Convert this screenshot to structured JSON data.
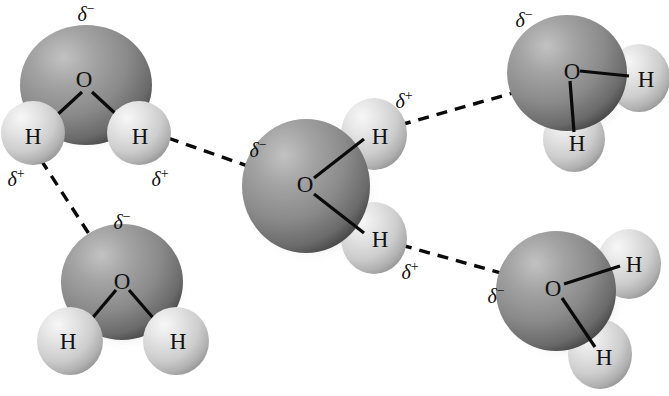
{
  "figure": {
    "background_color": "#ffffff",
    "width": 669,
    "height": 396,
    "atom_labels": {
      "oxygen": "O",
      "hydrogen": "H"
    },
    "charge_labels": {
      "negative": "δ",
      "negative_sign": "−",
      "positive": "δ",
      "positive_sign": "+"
    },
    "colors": {
      "oxygen_sphere_light": "#b9b9b9",
      "oxygen_sphere_mid": "#8d8d8d",
      "oxygen_sphere_dark": "#4f4f4f",
      "hydrogen_sphere_light": "#f2f2f2",
      "hydrogen_sphere_mid": "#d6d6d6",
      "hydrogen_sphere_dark": "#a3a3a3",
      "bond_color": "#0a0a0a",
      "text_color": "#111111"
    }
  },
  "molecules": [
    {
      "id": "water-top-left",
      "name": "water-molecule-top-left",
      "oxygen": {
        "label": "O",
        "cx": 86,
        "cy": 85,
        "rx": 66,
        "ry": 60,
        "label_x": 84,
        "label_y": 79
      },
      "hydrogens": [
        {
          "label": "H",
          "cx": 33,
          "cy": 133,
          "rx": 32,
          "ry": 32,
          "label_x": 33,
          "label_y": 136
        },
        {
          "label": "H",
          "cx": 139,
          "cy": 133,
          "rx": 32,
          "ry": 32,
          "label_x": 140,
          "label_y": 136
        }
      ],
      "charges": [
        {
          "kind": "negative",
          "x": 86,
          "y": 14
        },
        {
          "kind": "positive",
          "x": 16,
          "y": 179
        },
        {
          "kind": "positive",
          "x": 160,
          "y": 179
        }
      ]
    },
    {
      "id": "water-center",
      "name": "water-molecule-center",
      "oxygen": {
        "label": "O",
        "cx": 306,
        "cy": 186,
        "rx": 64,
        "ry": 67,
        "label_x": 305,
        "label_y": 184
      },
      "hydrogens": [
        {
          "label": "H",
          "cx": 374,
          "cy": 134,
          "rx": 33,
          "ry": 36,
          "label_x": 380,
          "label_y": 136
        },
        {
          "label": "H",
          "cx": 374,
          "cy": 238,
          "rx": 33,
          "ry": 36,
          "label_x": 380,
          "label_y": 239
        }
      ],
      "charges": [
        {
          "kind": "negative",
          "x": 258,
          "y": 150
        },
        {
          "kind": "positive",
          "x": 404,
          "y": 101
        },
        {
          "kind": "positive",
          "x": 410,
          "y": 272
        }
      ]
    },
    {
      "id": "water-top-right",
      "name": "water-molecule-top-right",
      "oxygen": {
        "label": "O",
        "cx": 567,
        "cy": 73,
        "rx": 60,
        "ry": 58,
        "label_x": 572,
        "label_y": 71
      },
      "hydrogens": [
        {
          "label": "H",
          "cx": 639,
          "cy": 78,
          "rx": 31,
          "ry": 34,
          "label_x": 646,
          "label_y": 79
        },
        {
          "label": "H",
          "cx": 574,
          "cy": 139,
          "rx": 31,
          "ry": 33,
          "label_x": 577,
          "label_y": 143
        }
      ],
      "charges": [
        {
          "kind": "negative",
          "x": 524,
          "y": 20
        }
      ]
    },
    {
      "id": "water-bottom-left",
      "name": "water-molecule-bottom-left",
      "oxygen": {
        "label": "O",
        "cx": 122,
        "cy": 282,
        "rx": 61,
        "ry": 58,
        "label_x": 122,
        "label_y": 281
      },
      "hydrogens": [
        {
          "label": "H",
          "cx": 70,
          "cy": 341,
          "rx": 33,
          "ry": 34,
          "label_x": 68,
          "label_y": 341
        },
        {
          "label": "H",
          "cx": 176,
          "cy": 341,
          "rx": 33,
          "ry": 34,
          "label_x": 178,
          "label_y": 341
        }
      ],
      "charges": [
        {
          "kind": "negative",
          "x": 122,
          "y": 222
        }
      ]
    },
    {
      "id": "water-bottom-right",
      "name": "water-molecule-bottom-right",
      "oxygen": {
        "label": "O",
        "cx": 556,
        "cy": 291,
        "rx": 60,
        "ry": 60,
        "label_x": 553,
        "label_y": 288
      },
      "hydrogens": [
        {
          "label": "H",
          "cx": 629,
          "cy": 264,
          "rx": 32,
          "ry": 35,
          "label_x": 634,
          "label_y": 264
        },
        {
          "label": "H",
          "cx": 600,
          "cy": 354,
          "rx": 32,
          "ry": 35,
          "label_x": 604,
          "label_y": 357
        }
      ],
      "charges": [
        {
          "kind": "negative",
          "x": 496,
          "y": 296
        }
      ]
    }
  ],
  "covalent_bonds": [
    {
      "name": "bond-top-left-o-h1",
      "x1": 82,
      "y1": 92,
      "x2": 43,
      "y2": 128
    },
    {
      "name": "bond-top-left-o-h2",
      "x1": 92,
      "y1": 92,
      "x2": 131,
      "y2": 128
    },
    {
      "name": "bond-center-o-h1",
      "x1": 314,
      "y1": 178,
      "x2": 364,
      "y2": 139
    },
    {
      "name": "bond-center-o-h2",
      "x1": 314,
      "y1": 194,
      "x2": 364,
      "y2": 233
    },
    {
      "name": "bond-top-right-o-h1",
      "x1": 580,
      "y1": 71,
      "x2": 629,
      "y2": 76
    },
    {
      "name": "bond-top-right-o-h2",
      "x1": 570,
      "y1": 81,
      "x2": 574,
      "y2": 132
    },
    {
      "name": "bond-bottom-left-o-h1",
      "x1": 116,
      "y1": 290,
      "x2": 79,
      "y2": 334
    },
    {
      "name": "bond-bottom-left-o-h2",
      "x1": 129,
      "y1": 290,
      "x2": 167,
      "y2": 334
    },
    {
      "name": "bond-bottom-right-o-h1",
      "x1": 564,
      "y1": 284,
      "x2": 620,
      "y2": 266
    },
    {
      "name": "bond-bottom-right-o-h2",
      "x1": 562,
      "y1": 298,
      "x2": 595,
      "y2": 347
    }
  ],
  "hydrogen_bonds": [
    {
      "name": "hbond-topleft-h-to-center-o",
      "x1": 168,
      "y1": 138,
      "x2": 296,
      "y2": 183,
      "label": "links top-left H to center O"
    },
    {
      "name": "hbond-topleft-h-to-bottomleft-o",
      "x1": 41,
      "y1": 160,
      "x2": 117,
      "y2": 277,
      "label": "links top-left H to bottom-left O"
    },
    {
      "name": "hbond-center-h-to-topright-o",
      "x1": 400,
      "y1": 125,
      "x2": 562,
      "y2": 79,
      "label": "links center H to top-right O"
    },
    {
      "name": "hbond-center-h-to-bottomright-o",
      "x1": 401,
      "y1": 245,
      "x2": 551,
      "y2": 287,
      "label": "links center H to bottom-right O"
    }
  ]
}
